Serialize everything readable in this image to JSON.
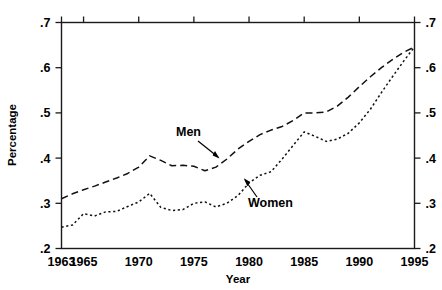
{
  "chart_data": {
    "type": "line",
    "title": "",
    "xlabel": "Year",
    "ylabel": "Percentage",
    "xlim": [
      1963,
      1995
    ],
    "ylim": [
      0.2,
      0.7
    ],
    "grid": false,
    "legend_position": "inline-annotations",
    "xticklabels": [
      "1963",
      "1965",
      "1970",
      "1975",
      "1980",
      "1985",
      "1990",
      "1995"
    ],
    "xtickvalues": [
      1963,
      1965,
      1970,
      1975,
      1980,
      1985,
      1990,
      1995
    ],
    "yticklabels": [
      ".2",
      ".3",
      ".4",
      ".5",
      ".6",
      ".7"
    ],
    "ytickvalues": [
      0.2,
      0.3,
      0.4,
      0.5,
      0.6,
      0.7
    ],
    "yticklabels_right": [
      ".2",
      ".3",
      ".4",
      ".5",
      ".6",
      ".7"
    ],
    "annotations": [
      {
        "text": "Men",
        "x": 1972.0,
        "y": 0.455
      },
      {
        "text": "Women",
        "x": 1982.5,
        "y": 0.345
      }
    ],
    "series": [
      {
        "name": "Men",
        "dash": "long-dash",
        "x": [
          1963,
          1964,
          1965,
          1966,
          1967,
          1968,
          1969,
          1970,
          1971,
          1972,
          1973,
          1974,
          1975,
          1976,
          1977,
          1978,
          1979,
          1980,
          1981,
          1982,
          1983,
          1984,
          1985,
          1986,
          1987,
          1988,
          1989,
          1990,
          1991,
          1992,
          1993,
          1994,
          1995
        ],
        "values": [
          0.31,
          0.321,
          0.33,
          0.338,
          0.347,
          0.356,
          0.366,
          0.38,
          0.405,
          0.395,
          0.383,
          0.384,
          0.382,
          0.372,
          0.38,
          0.398,
          0.42,
          0.437,
          0.452,
          0.462,
          0.47,
          0.483,
          0.5,
          0.5,
          0.502,
          0.515,
          0.535,
          0.558,
          0.58,
          0.6,
          0.618,
          0.634,
          0.646
        ]
      },
      {
        "name": "Women",
        "dash": "dotted",
        "x": [
          1963,
          1964,
          1965,
          1966,
          1967,
          1968,
          1969,
          1970,
          1971,
          1972,
          1973,
          1974,
          1975,
          1976,
          1977,
          1978,
          1979,
          1980,
          1981,
          1982,
          1983,
          1984,
          1985,
          1986,
          1987,
          1988,
          1989,
          1990,
          1991,
          1992,
          1993,
          1994,
          1995
        ],
        "values": [
          0.247,
          0.252,
          0.277,
          0.272,
          0.281,
          0.282,
          0.293,
          0.303,
          0.322,
          0.291,
          0.284,
          0.286,
          0.3,
          0.303,
          0.292,
          0.3,
          0.317,
          0.345,
          0.362,
          0.37,
          0.398,
          0.428,
          0.458,
          0.448,
          0.437,
          0.442,
          0.455,
          0.478,
          0.508,
          0.545,
          0.58,
          0.614,
          0.646
        ]
      }
    ]
  }
}
